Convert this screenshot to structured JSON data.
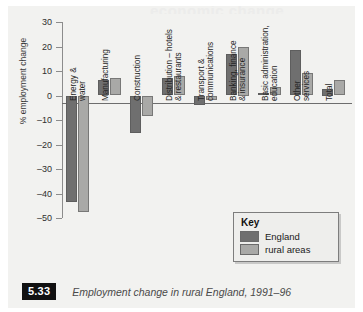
{
  "figure": {
    "number": "5.33",
    "caption": "Employment change in rural England, 1991–96",
    "ghost_headline": "economic change"
  },
  "key": {
    "title": "Key",
    "entries": [
      {
        "label": "England",
        "color": "#6f6f6f"
      },
      {
        "label": "rural areas",
        "color": "#a9a9a7"
      }
    ]
  },
  "chart_data": {
    "type": "bar",
    "title": "Employment change in rural England, 1991–96",
    "xlabel": "",
    "ylabel": "% employment change",
    "ylim": [
      -50,
      30
    ],
    "yticks": [
      30,
      20,
      10,
      0,
      -10,
      -20,
      -30,
      -40,
      -50
    ],
    "ytick_labels": [
      "30",
      "20",
      "10",
      "0",
      "–10",
      "–20",
      "–30",
      "–40",
      "–50"
    ],
    "grid": false,
    "legend_position": "lower-right",
    "categories": [
      "Energy & water",
      "Manufacturing",
      "Construction",
      "Distribution – hotels & restaurants",
      "Transport & communications",
      "Banking, finance & insurance",
      "Basic administration, education",
      "Other services",
      "Total"
    ],
    "category_lines": [
      [
        "Energy &",
        "water"
      ],
      [
        "Manufacturing"
      ],
      [
        "Construction"
      ],
      [
        "Distribution – hotels",
        "& restaurants"
      ],
      [
        "Transport &",
        "communications"
      ],
      [
        "Banking, finance",
        "& insurance"
      ],
      [
        "Basic administration,",
        "education"
      ],
      [
        "Other",
        "services"
      ],
      [
        "Total"
      ]
    ],
    "series": [
      {
        "name": "England",
        "color": "#6f6f6f",
        "values": [
          -43.5,
          6.5,
          -15.5,
          7.0,
          -4.0,
          17.0,
          1.0,
          18.5,
          2.5
        ]
      },
      {
        "name": "rural areas",
        "color": "#a9a9a7",
        "values": [
          -47.5,
          7.0,
          -8.5,
          8.0,
          -2.0,
          20.0,
          3.5,
          9.0,
          6.5
        ]
      }
    ]
  }
}
